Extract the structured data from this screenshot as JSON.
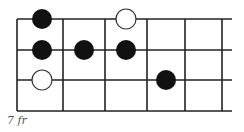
{
  "diagram": {
    "type": "fretboard-scale-diagram",
    "fret_label": "7 fr",
    "colors": {
      "line": "#222222",
      "dot_filled": "#111111",
      "dot_open_fill": "#ffffff",
      "dot_open_stroke": "#333333"
    },
    "strings_y": [
      19,
      50,
      80,
      111
    ],
    "frets_x": [
      17,
      63,
      105,
      147,
      185,
      222
    ],
    "string_end_x": 232,
    "dots": [
      {
        "x": 42,
        "y": 19,
        "type": "filled"
      },
      {
        "x": 126,
        "y": 19,
        "type": "open"
      },
      {
        "x": 42,
        "y": 50,
        "type": "filled"
      },
      {
        "x": 84,
        "y": 50,
        "type": "filled"
      },
      {
        "x": 126,
        "y": 50,
        "type": "filled"
      },
      {
        "x": 42,
        "y": 80,
        "type": "open"
      },
      {
        "x": 166,
        "y": 80,
        "type": "filled"
      }
    ]
  }
}
